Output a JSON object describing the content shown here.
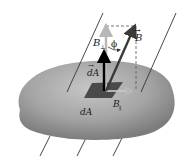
{
  "diagram": {
    "labels": {
      "b_vector": "B",
      "b_perp": "B",
      "b_perp_sub": "⊥",
      "b_par": "B",
      "b_par_sub": "∥",
      "phi": "ϕ",
      "da_vector": "dA",
      "da_scalar": "dA"
    },
    "colors": {
      "surface": "#9a9a9a",
      "surface_highlight": "#c4c4c4",
      "patch": "#4a4a4a",
      "field_line": "#333333",
      "b_arrow": "#3a3a3a",
      "b_perp_arrow": "#b8b8b8",
      "da_arrow": "#000000",
      "dashed": "#555555"
    }
  }
}
